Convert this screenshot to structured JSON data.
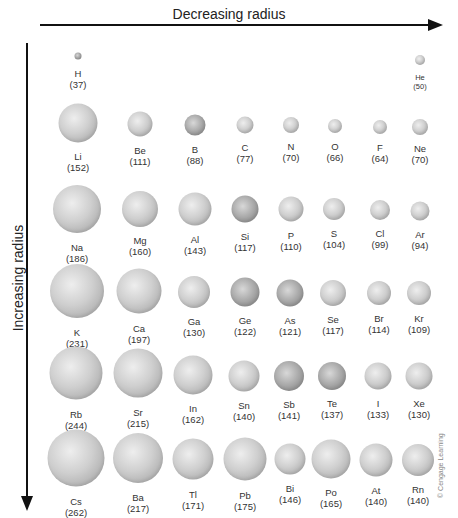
{
  "axes": {
    "top_label": "Decreasing radius",
    "left_label": "Increasing radius"
  },
  "credit": "© Cengage Learning",
  "units_note": "",
  "elements": [
    {
      "symbol": "H",
      "radius": "(37)",
      "x": 78,
      "y": 56,
      "d": 7,
      "dark": true,
      "small": false
    },
    {
      "symbol": "He",
      "radius": "(50)",
      "x": 420,
      "y": 60,
      "d": 10,
      "dark": false,
      "small": true
    },
    {
      "symbol": "Li",
      "radius": "(152)",
      "x": 78,
      "y": 123,
      "d": 39,
      "dark": false
    },
    {
      "symbol": "Be",
      "radius": "(111)",
      "x": 140,
      "y": 124,
      "d": 25,
      "dark": false
    },
    {
      "symbol": "B",
      "radius": "(88)",
      "x": 195,
      "y": 125,
      "d": 21,
      "dark": true
    },
    {
      "symbol": "C",
      "radius": "(77)",
      "x": 245,
      "y": 125,
      "d": 17,
      "dark": false
    },
    {
      "symbol": "N",
      "radius": "(70)",
      "x": 291,
      "y": 125,
      "d": 16,
      "dark": false
    },
    {
      "symbol": "O",
      "radius": "(66)",
      "x": 335,
      "y": 126,
      "d": 14,
      "dark": false
    },
    {
      "symbol": "F",
      "radius": "(64)",
      "x": 380,
      "y": 127,
      "d": 14,
      "dark": false
    },
    {
      "symbol": "Ne",
      "radius": "(70)",
      "x": 420,
      "y": 127,
      "d": 16,
      "dark": false
    },
    {
      "symbol": "Na",
      "radius": "(186)",
      "x": 77,
      "y": 209,
      "d": 48,
      "dark": false
    },
    {
      "symbol": "Mg",
      "radius": "(160)",
      "x": 140,
      "y": 209,
      "d": 36,
      "dark": false
    },
    {
      "symbol": "Al",
      "radius": "(143)",
      "x": 195,
      "y": 209,
      "d": 33,
      "dark": false
    },
    {
      "symbol": "Si",
      "radius": "(117)",
      "x": 245,
      "y": 209,
      "d": 27,
      "dark": true
    },
    {
      "symbol": "P",
      "radius": "(110)",
      "x": 291,
      "y": 209,
      "d": 25,
      "dark": false
    },
    {
      "symbol": "S",
      "radius": "(104)",
      "x": 334,
      "y": 209,
      "d": 22,
      "dark": false
    },
    {
      "symbol": "Cl",
      "radius": "(99)",
      "x": 380,
      "y": 210,
      "d": 20,
      "dark": false
    },
    {
      "symbol": "Ar",
      "radius": "(94)",
      "x": 420,
      "y": 211,
      "d": 19,
      "dark": false
    },
    {
      "symbol": "K",
      "radius": "(231)",
      "x": 77,
      "y": 291,
      "d": 54,
      "dark": false
    },
    {
      "symbol": "Ca",
      "radius": "(197)",
      "x": 139,
      "y": 291,
      "d": 45,
      "dark": false
    },
    {
      "symbol": "Ga",
      "radius": "(130)",
      "x": 194,
      "y": 292,
      "d": 32,
      "dark": false
    },
    {
      "symbol": "Ge",
      "radius": "(122)",
      "x": 245,
      "y": 292,
      "d": 29,
      "dark": true
    },
    {
      "symbol": "As",
      "radius": "(121)",
      "x": 290,
      "y": 293,
      "d": 27,
      "dark": true
    },
    {
      "symbol": "Se",
      "radius": "(117)",
      "x": 333,
      "y": 293,
      "d": 26,
      "dark": false
    },
    {
      "symbol": "Br",
      "radius": "(114)",
      "x": 379,
      "y": 293,
      "d": 24,
      "dark": false
    },
    {
      "symbol": "Kr",
      "radius": "(109)",
      "x": 419,
      "y": 293,
      "d": 24,
      "dark": false
    },
    {
      "symbol": "Rb",
      "radius": "(244)",
      "x": 76,
      "y": 373,
      "d": 53,
      "dark": false
    },
    {
      "symbol": "Sr",
      "radius": "(215)",
      "x": 138,
      "y": 373,
      "d": 49,
      "dark": false
    },
    {
      "symbol": "In",
      "radius": "(162)",
      "x": 193,
      "y": 375,
      "d": 39,
      "dark": false
    },
    {
      "symbol": "Sn",
      "radius": "(140)",
      "x": 244,
      "y": 376,
      "d": 31,
      "dark": false
    },
    {
      "symbol": "Sb",
      "radius": "(141)",
      "x": 289,
      "y": 376,
      "d": 30,
      "dark": true
    },
    {
      "symbol": "Te",
      "radius": "(137)",
      "x": 332,
      "y": 376,
      "d": 28,
      "dark": true
    },
    {
      "symbol": "I",
      "radius": "(133)",
      "x": 378,
      "y": 376,
      "d": 27,
      "dark": false
    },
    {
      "symbol": "Xe",
      "radius": "(130)",
      "x": 419,
      "y": 376,
      "d": 27,
      "dark": false
    },
    {
      "symbol": "Cs",
      "radius": "(262)",
      "x": 76,
      "y": 458,
      "d": 57,
      "dark": false
    },
    {
      "symbol": "Ba",
      "radius": "(217)",
      "x": 138,
      "y": 458,
      "d": 50,
      "dark": false
    },
    {
      "symbol": "Tl",
      "radius": "(171)",
      "x": 193,
      "y": 459,
      "d": 41,
      "dark": false
    },
    {
      "symbol": "Pb",
      "radius": "(175)",
      "x": 245,
      "y": 459,
      "d": 43,
      "dark": false
    },
    {
      "symbol": "Bi",
      "radius": "(146)",
      "x": 290,
      "y": 459,
      "d": 31,
      "dark": false
    },
    {
      "symbol": "Po",
      "radius": "(165)",
      "x": 331,
      "y": 459,
      "d": 39,
      "dark": false
    },
    {
      "symbol": "At",
      "radius": "(140)",
      "x": 376,
      "y": 460,
      "d": 33,
      "dark": false
    },
    {
      "symbol": "Rn",
      "radius": "(140)",
      "x": 418,
      "y": 460,
      "d": 32,
      "dark": false
    }
  ]
}
